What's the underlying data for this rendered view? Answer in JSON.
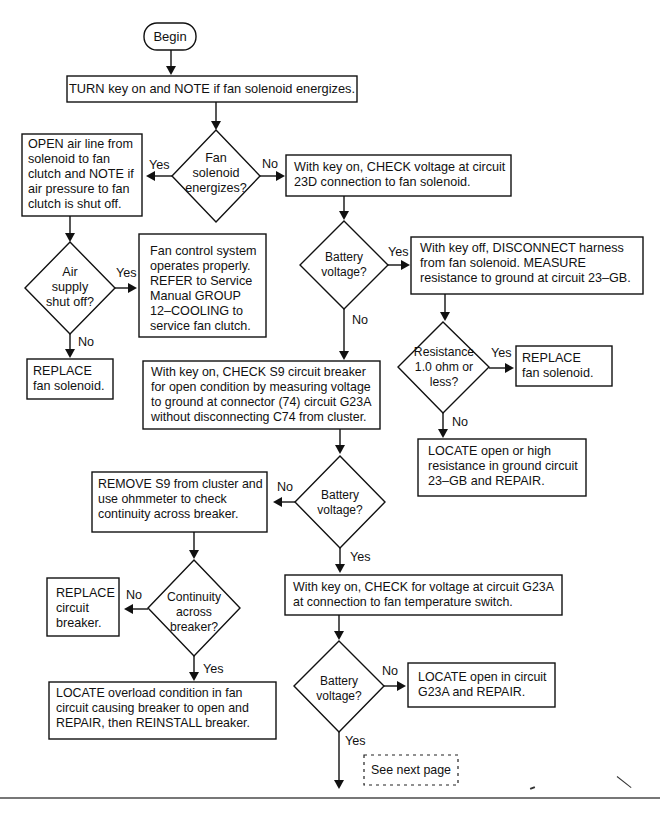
{
  "diagram": {
    "type": "flowchart",
    "start": {
      "label": "Begin"
    },
    "nodes": {
      "step_turn_key": "TURN key on and NOTE if fan solenoid energizes.",
      "dec_fan_solenoid": [
        "Fan",
        "solenoid",
        "energizes?"
      ],
      "step_open_air_line": [
        "OPEN air line from",
        "solenoid to fan",
        "clutch and NOTE if",
        "air pressure to fan",
        "clutch is shut off."
      ],
      "step_check_23d": [
        "With key on, CHECK voltage at circuit",
        "23D connection to fan solenoid."
      ],
      "dec_air_supply": [
        "Air",
        "supply",
        "shut off?"
      ],
      "step_fan_ok": [
        "Fan control system",
        "operates properly.",
        "REFER to Service",
        "Manual GROUP",
        "12–COOLING to",
        "service fan clutch."
      ],
      "dec_battery_1": [
        "Battery",
        "voltage?"
      ],
      "step_disconnect_harness": [
        "With key off, DISCONNECT harness",
        "from fan solenoid. MEASURE",
        "resistance to ground at circuit 23–GB."
      ],
      "step_replace_solenoid_1": [
        "REPLACE",
        "fan solenoid."
      ],
      "dec_resistance": [
        "Resistance",
        "1.0 ohm or",
        "less?"
      ],
      "step_replace_solenoid_2": [
        "REPLACE",
        "fan solenoid."
      ],
      "step_check_s9": [
        "With key on, CHECK S9 circuit breaker",
        "for open condition by measuring voltage",
        "to ground at connector (74) circuit G23A",
        "without disconnecting C74 from cluster."
      ],
      "step_locate_23gb": [
        "LOCATE open or high",
        "resistance in ground circuit",
        "23–GB and REPAIR."
      ],
      "dec_battery_2": [
        "Battery",
        "voltage?"
      ],
      "step_remove_s9": [
        "REMOVE S9 from cluster and",
        "use ohmmeter to check",
        "continuity across breaker."
      ],
      "step_replace_breaker": [
        "REPLACE",
        "circuit",
        "breaker."
      ],
      "dec_continuity": [
        "Continuity",
        "across",
        "breaker?"
      ],
      "step_check_g23a": [
        "With key on, CHECK for voltage at circuit G23A",
        "at connection to fan temperature switch."
      ],
      "step_locate_overload": [
        "LOCATE overload condition in fan",
        "circuit causing breaker to open and",
        "REPAIR, then REINSTALL breaker."
      ],
      "dec_battery_3": [
        "Battery",
        "voltage?"
      ],
      "step_locate_g23a": [
        "LOCATE open in circuit",
        "G23A and REPAIR."
      ],
      "continuation": "See next page"
    },
    "edge_labels": {
      "yes": "Yes",
      "no": "No"
    },
    "colors": {
      "line": "#111111",
      "background": "#ffffff",
      "rule": "#777777"
    }
  }
}
